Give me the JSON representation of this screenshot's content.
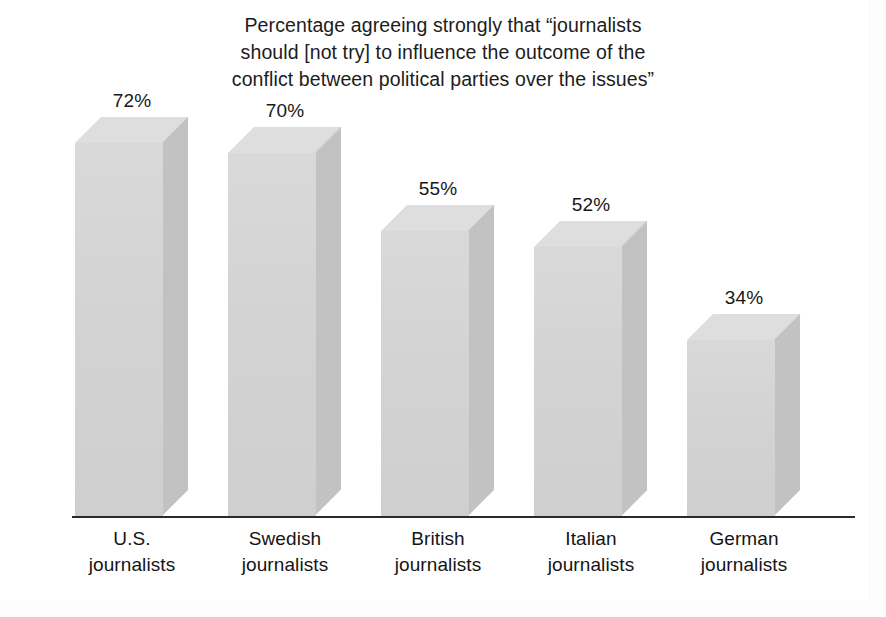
{
  "chart_data": {
    "type": "bar",
    "title": "Percentage agreeing strongly that “journalists\nshould [not try] to influence the outcome of the\nconflict between political parties over the issues”",
    "xlabel": "",
    "ylabel": "",
    "ylim": [
      0,
      100
    ],
    "grid": false,
    "legend": "none",
    "value_suffix": "%",
    "categories": [
      "U.S. journalists",
      "Swedish journalists",
      "British journalists",
      "Italian journalists",
      "German journalists"
    ],
    "values": [
      72,
      70,
      55,
      52,
      34
    ],
    "value_labels": [
      "72%",
      "70%",
      "55%",
      "52%",
      "34%"
    ],
    "category_lines": [
      [
        "U.S.",
        "journalists"
      ],
      [
        "Swedish",
        "journalists"
      ],
      [
        "British",
        "journalists"
      ],
      [
        "Italian",
        "journalists"
      ],
      [
        "German",
        "journalists"
      ]
    ],
    "style": {
      "bar_front_color": "#d4d4d4",
      "bar_side_color": "#c2c2c2",
      "bar_top_color": "#dedede",
      "axis_color": "#2a2a2a",
      "text_color": "#161616",
      "background_color": "#ffffff",
      "three_d": true
    }
  }
}
